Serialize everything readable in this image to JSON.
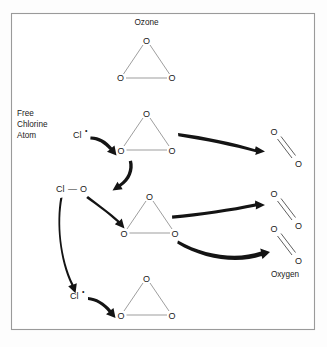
{
  "figure": {
    "title_label": "Ozone",
    "oxygen_label": "Oxygen",
    "free_chlorine_caption": {
      "line1": "Free",
      "line2": "Chlorine",
      "line3": "Atom"
    },
    "atom_symbols": {
      "oxygen": "O",
      "chlorine": "Cl",
      "radical_dot": "•",
      "bond_dash": "—"
    },
    "colors": {
      "frame_border": "#9a9a9a",
      "background": "#fdfdfd",
      "panel": "#ffffff",
      "bond": "#8c8c8c",
      "bond_dark": "#4d4d4d",
      "arrow": "#141414",
      "text": "#1a1a1a"
    },
    "species": {
      "ozone_top": {
        "name": "ozone-molecule-top",
        "apex": "O",
        "left": "O",
        "right": "O"
      },
      "ozone_row1": {
        "name": "ozone-molecule-row1",
        "apex": "O",
        "left": "O",
        "right": "O"
      },
      "ozone_row2": {
        "name": "ozone-molecule-row2",
        "apex": "O",
        "left": "O",
        "right": "O"
      },
      "ozone_row3": {
        "name": "ozone-molecule-row3",
        "apex": "O",
        "left": "O",
        "right": "O"
      },
      "chlorine_radical_1": {
        "name": "chlorine-radical-top",
        "symbol": "Cl",
        "dot": "•"
      },
      "chlorine_monoxide": {
        "name": "chlorine-monoxide",
        "left": "Cl",
        "bond": "—",
        "right": "O"
      },
      "chlorine_radical_2": {
        "name": "chlorine-radical-bottom",
        "symbol": "Cl",
        "dot": "•"
      },
      "oxygen_1": {
        "name": "oxygen-molecule-1",
        "top": "O",
        "bottom": "O"
      },
      "oxygen_2": {
        "name": "oxygen-molecule-2",
        "top": "O",
        "bottom": "O"
      },
      "oxygen_3": {
        "name": "oxygen-molecule-3",
        "top": "O",
        "bottom": "O"
      }
    }
  }
}
